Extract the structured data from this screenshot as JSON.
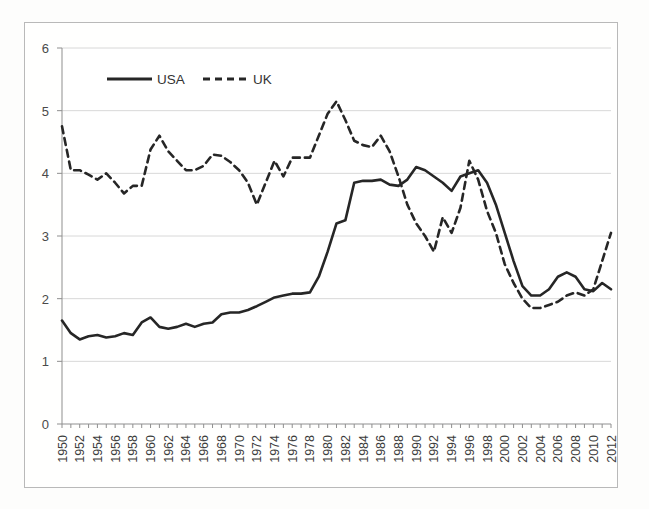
{
  "chart_data": {
    "type": "line",
    "title": "",
    "subtitle": "",
    "xlabel": "",
    "ylabel": "",
    "xlim": [
      1950,
      2012
    ],
    "ylim": [
      0,
      6
    ],
    "yticks": [
      0,
      1,
      2,
      3,
      4,
      5,
      6
    ],
    "ytick_labels": [
      "0",
      "1",
      "2",
      "3",
      "4",
      "5",
      "6"
    ],
    "grid": true,
    "grid_axis": "y",
    "legend": [
      "USA",
      "UK"
    ],
    "legend_position": "top-left-inside",
    "x": [
      1950,
      1951,
      1952,
      1953,
      1954,
      1955,
      1956,
      1957,
      1958,
      1959,
      1960,
      1961,
      1962,
      1963,
      1964,
      1965,
      1966,
      1967,
      1968,
      1969,
      1970,
      1971,
      1972,
      1973,
      1974,
      1975,
      1976,
      1977,
      1978,
      1979,
      1980,
      1981,
      1982,
      1983,
      1984,
      1985,
      1986,
      1987,
      1988,
      1989,
      1990,
      1991,
      1992,
      1993,
      1994,
      1995,
      1996,
      1997,
      1998,
      1999,
      2000,
      2001,
      2002,
      2003,
      2004,
      2005,
      2006,
      2007,
      2008,
      2009,
      2010,
      2011,
      2012
    ],
    "xtick_labels": [
      "1950",
      "1952",
      "1954",
      "1956",
      "1958",
      "1960",
      "1962",
      "1964",
      "1966",
      "1968",
      "1970",
      "1972",
      "1974",
      "1976",
      "1978",
      "1980",
      "1982",
      "1984",
      "1986",
      "1988",
      "1990",
      "1992",
      "1994",
      "1996",
      "1998",
      "2000",
      "2002",
      "2004",
      "2006",
      "2008",
      "2010",
      "2012"
    ],
    "series": [
      {
        "name": "USA",
        "style": "solid",
        "color": "#262626",
        "values": [
          1.65,
          1.45,
          1.35,
          1.4,
          1.42,
          1.38,
          1.4,
          1.45,
          1.42,
          1.62,
          1.7,
          1.55,
          1.52,
          1.55,
          1.6,
          1.55,
          1.6,
          1.62,
          1.75,
          1.78,
          1.78,
          1.82,
          1.88,
          1.95,
          2.02,
          2.05,
          2.08,
          2.08,
          2.1,
          2.35,
          2.75,
          3.2,
          3.25,
          3.85,
          3.88,
          3.88,
          3.9,
          3.82,
          3.8,
          3.9,
          4.1,
          4.05,
          3.95,
          3.85,
          3.72,
          3.95,
          4.0,
          4.05,
          3.85,
          3.5,
          3.05,
          2.6,
          2.2,
          2.05,
          2.05,
          2.15,
          2.35,
          2.42,
          2.35,
          2.15,
          2.12,
          2.25,
          2.15
        ]
      },
      {
        "name": "UK",
        "style": "dashed",
        "color": "#262626",
        "values": [
          4.75,
          4.05,
          4.05,
          3.98,
          3.9,
          4.0,
          3.85,
          3.68,
          3.8,
          3.8,
          4.38,
          4.6,
          4.35,
          4.2,
          4.05,
          4.05,
          4.12,
          4.3,
          4.28,
          4.18,
          4.05,
          3.85,
          3.5,
          3.85,
          4.2,
          3.95,
          4.25,
          4.25,
          4.25,
          4.6,
          4.95,
          5.15,
          4.85,
          4.52,
          4.45,
          4.42,
          4.6,
          4.35,
          3.95,
          3.5,
          3.2,
          3.0,
          2.75,
          3.3,
          3.05,
          3.45,
          4.2,
          3.9,
          3.4,
          3.05,
          2.55,
          2.25,
          2.0,
          1.85,
          1.85,
          1.9,
          1.95,
          2.05,
          2.1,
          2.05,
          2.15,
          2.6,
          3.05
        ]
      }
    ]
  },
  "legend": {
    "items": [
      {
        "label": "USA",
        "style": "solid"
      },
      {
        "label": "UK",
        "style": "dashed"
      }
    ]
  }
}
